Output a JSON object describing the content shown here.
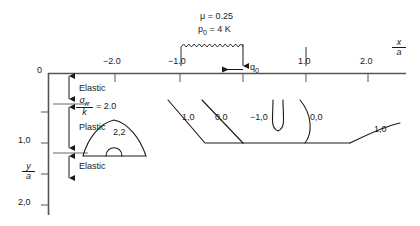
{
  "figure": {
    "type": "contour-diagram",
    "parameters": {
      "friction_label": "μ = 0.25",
      "pressure_label": "p",
      "pressure_sub": "0",
      "pressure_value": " = 4 K"
    },
    "load_arrow_label": "q",
    "load_arrow_sub": "0",
    "x_axis": {
      "label_num": "x",
      "label_den": "a",
      "ticks": [
        {
          "value": -2.0,
          "label": "−2.0",
          "x": 115
        },
        {
          "value": -1.0,
          "label": "−1.0",
          "x": 180
        },
        {
          "value": 0.0,
          "label": "",
          "x": 243
        },
        {
          "value": 1.0,
          "label": "1.0",
          "x": 306
        },
        {
          "value": 2.0,
          "label": "2.0",
          "x": 368
        }
      ],
      "origin_label": "0"
    },
    "y_axis": {
      "label_num": "y",
      "label_den": "a",
      "ticks": [
        {
          "value": 0.0,
          "label": "0",
          "y": 73
        },
        {
          "value": 0.5,
          "label": "",
          "y": 112
        },
        {
          "value": 1.0,
          "label": "1,0",
          "y": 143
        },
        {
          "value": 1.5,
          "label": "",
          "y": 174
        },
        {
          "value": 2.0,
          "label": "2,0",
          "y": 205
        }
      ]
    },
    "zones": [
      {
        "name": "Elastic",
        "label": "Elastic",
        "top": 76,
        "bottom": 105
      },
      {
        "name": "Plastic",
        "label": "Plastic",
        "top": 106,
        "bottom": 155
      },
      {
        "name": "Elastic",
        "label": "Elastic",
        "top": 156,
        "bottom": 186
      }
    ],
    "stress_ratio": {
      "num": "σ",
      "num_sub": "rr",
      "den": "k",
      "equals": "= 2.0"
    },
    "contour_labels": [
      {
        "id": "contour-2-2",
        "text": "2,2",
        "x": 113,
        "y": 128
      },
      {
        "id": "contour-left-1-0",
        "text": "1,0",
        "x": 182,
        "y": 113
      },
      {
        "id": "contour-left-0-0",
        "text": "0,0",
        "x": 215,
        "y": 113
      },
      {
        "id": "contour-center-neg-1",
        "text": "−1,0",
        "x": 258,
        "y": 113
      },
      {
        "id": "contour-right-0-0",
        "text": "0,0",
        "x": 314,
        "y": 113
      },
      {
        "id": "contour-far-right-1",
        "text": "1,0",
        "x": 378,
        "y": 125
      }
    ]
  }
}
